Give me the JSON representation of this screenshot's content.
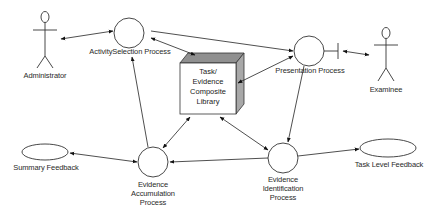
{
  "diagram": {
    "actors": [
      {
        "id": "administrator",
        "label": "Administrator"
      },
      {
        "id": "examinee",
        "label": "Examinee"
      }
    ],
    "processes": [
      {
        "id": "activity-selection",
        "label": "ActivitySelection Process"
      },
      {
        "id": "presentation",
        "label": "Presentation Process"
      },
      {
        "id": "evidence-accumulation",
        "label_lines": [
          "Evidence",
          "Accumulation",
          "Process"
        ]
      },
      {
        "id": "evidence-identification",
        "label_lines": [
          "Evidence",
          "Identification",
          "Process"
        ]
      }
    ],
    "library": {
      "label_lines": [
        "Task/",
        "Evidence",
        "Composite",
        "Library"
      ]
    },
    "outputs": [
      {
        "id": "summary-feedback",
        "label": "Summary Feedback"
      },
      {
        "id": "task-level-feedback",
        "label": "Task Level Feedback"
      }
    ],
    "connections": [
      {
        "from": "administrator",
        "to": "activity-selection",
        "type": "bidirectional"
      },
      {
        "from": "activity-selection",
        "to": "presentation",
        "type": "directed"
      },
      {
        "from": "library",
        "to": "activity-selection",
        "type": "bidirectional"
      },
      {
        "from": "library",
        "to": "presentation",
        "type": "bidirectional"
      },
      {
        "from": "presentation",
        "to": "examinee",
        "type": "bidirectional"
      },
      {
        "from": "presentation",
        "to": "evidence-identification",
        "type": "directed"
      },
      {
        "from": "library",
        "to": "evidence-accumulation",
        "type": "bidirectional"
      },
      {
        "from": "library",
        "to": "evidence-identification",
        "type": "bidirectional"
      },
      {
        "from": "evidence-identification",
        "to": "evidence-accumulation",
        "type": "directed"
      },
      {
        "from": "evidence-accumulation",
        "to": "activity-selection",
        "type": "directed"
      },
      {
        "from": "evidence-accumulation",
        "to": "summary-feedback",
        "type": "directed"
      },
      {
        "from": "evidence-identification",
        "to": "task-level-feedback",
        "type": "directed"
      }
    ]
  }
}
